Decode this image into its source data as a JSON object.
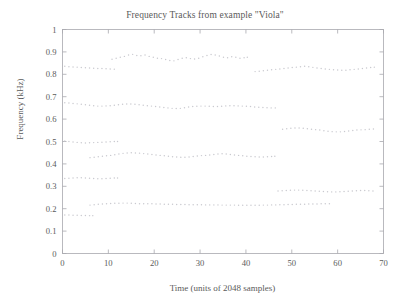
{
  "chart_data": {
    "type": "line",
    "title": "Frequency Tracks from example \"Viola\"",
    "xlabel": "Time (units of 2048 samples)",
    "ylabel": "Frequency (kHz)",
    "xlim": [
      0,
      70
    ],
    "ylim": [
      0,
      1
    ],
    "xticks": [
      0,
      10,
      20,
      30,
      40,
      50,
      60,
      70
    ],
    "yticks": [
      0,
      0.1,
      0.2,
      0.3,
      0.4,
      0.5,
      0.6,
      0.7,
      0.8,
      0.9,
      1
    ],
    "xtick_labels": [
      "0",
      "10",
      "20",
      "30",
      "40",
      "50",
      "60",
      "70"
    ],
    "ytick_labels": [
      "0",
      "0.1",
      "0.2",
      "0.3",
      "0.4",
      "0.5",
      "0.6",
      "0.7",
      "0.8",
      "0.9",
      "1"
    ],
    "grid": false,
    "legend": null,
    "marker": "dotted",
    "series_color": "#c9c9cf",
    "series": [
      {
        "name": "track-1-upper-left",
        "x": [
          0.5,
          1.4,
          2.3,
          3.2,
          4.1,
          5.0,
          5.9,
          6.8,
          7.7,
          8.6,
          9.5,
          10.4,
          11.3
        ],
        "values": [
          0.836,
          0.834,
          0.833,
          0.832,
          0.83,
          0.829,
          0.828,
          0.827,
          0.826,
          0.826,
          0.825,
          0.824,
          0.823
        ]
      },
      {
        "name": "track-2-upper-mid",
        "x": [
          10.8,
          11.7,
          12.6,
          13.5,
          14.4,
          15.3,
          16.2,
          17.1,
          18.0,
          18.9,
          19.8,
          20.7,
          21.6,
          22.5,
          23.4,
          24.3,
          25.2,
          26.1,
          27.0,
          27.9,
          28.8,
          29.7,
          30.6,
          31.5,
          32.4,
          33.3,
          34.2,
          35.1,
          36.0,
          36.9,
          37.8,
          38.7,
          39.6,
          40.3
        ],
        "values": [
          0.867,
          0.872,
          0.876,
          0.88,
          0.886,
          0.889,
          0.884,
          0.883,
          0.886,
          0.88,
          0.876,
          0.872,
          0.87,
          0.866,
          0.862,
          0.86,
          0.866,
          0.872,
          0.874,
          0.87,
          0.868,
          0.872,
          0.878,
          0.884,
          0.888,
          0.886,
          0.882,
          0.876,
          0.874,
          0.878,
          0.876,
          0.872,
          0.874,
          0.876
        ]
      },
      {
        "name": "track-3-upper-right",
        "x": [
          42.0,
          42.9,
          43.8,
          44.7,
          45.6,
          46.5,
          47.4,
          48.3,
          49.2,
          50.1,
          51.0,
          51.9,
          52.8,
          53.7,
          54.6,
          55.5,
          56.4,
          57.3,
          58.2,
          59.1,
          60.0,
          60.9,
          61.8,
          62.7,
          63.6,
          64.5,
          65.4,
          66.3,
          67.2,
          68.0
        ],
        "values": [
          0.812,
          0.814,
          0.816,
          0.818,
          0.82,
          0.822,
          0.824,
          0.826,
          0.828,
          0.83,
          0.832,
          0.834,
          0.836,
          0.834,
          0.831,
          0.828,
          0.826,
          0.824,
          0.822,
          0.82,
          0.819,
          0.818,
          0.818,
          0.82,
          0.822,
          0.824,
          0.826,
          0.828,
          0.83,
          0.832
        ]
      },
      {
        "name": "track-4-mid-left",
        "x": [
          0.5,
          1.4,
          2.3,
          3.2,
          4.1,
          5.0,
          5.9,
          6.8,
          7.7,
          8.6,
          9.5,
          10.4,
          11.3,
          12.2,
          13.1,
          14.0,
          14.9,
          15.8,
          16.7,
          17.6,
          18.5,
          19.4,
          20.3,
          21.2,
          22.1,
          23.0,
          23.9,
          24.8,
          25.7,
          26.6,
          27.5,
          28.4,
          29.3,
          30.2,
          31.1,
          32.0,
          32.9,
          33.8,
          34.7,
          35.6,
          36.5,
          37.4,
          38.3,
          39.2,
          40.1,
          41.0,
          41.9,
          42.8,
          43.7,
          44.6,
          45.5,
          46.4
        ],
        "values": [
          0.673,
          0.672,
          0.67,
          0.668,
          0.666,
          0.664,
          0.662,
          0.66,
          0.658,
          0.658,
          0.659,
          0.66,
          0.662,
          0.664,
          0.666,
          0.667,
          0.667,
          0.666,
          0.664,
          0.662,
          0.66,
          0.658,
          0.656,
          0.654,
          0.652,
          0.65,
          0.648,
          0.647,
          0.648,
          0.651,
          0.654,
          0.656,
          0.657,
          0.658,
          0.658,
          0.657,
          0.656,
          0.656,
          0.657,
          0.659,
          0.66,
          0.66,
          0.659,
          0.658,
          0.657,
          0.656,
          0.654,
          0.653,
          0.652,
          0.651,
          0.65,
          0.65
        ]
      },
      {
        "name": "track-5-mid-right",
        "x": [
          48.0,
          48.9,
          49.8,
          50.7,
          51.6,
          52.5,
          53.4,
          54.3,
          55.2,
          56.1,
          57.0,
          57.9,
          58.8,
          59.7,
          60.6,
          61.5,
          62.4,
          63.3,
          64.2,
          65.1,
          66.0,
          66.9,
          67.8
        ],
        "values": [
          0.555,
          0.557,
          0.559,
          0.56,
          0.56,
          0.559,
          0.557,
          0.555,
          0.553,
          0.551,
          0.548,
          0.546,
          0.544,
          0.543,
          0.543,
          0.545,
          0.547,
          0.549,
          0.551,
          0.552,
          0.553,
          0.555,
          0.556
        ]
      },
      {
        "name": "track-6-left-0p50",
        "x": [
          0.5,
          1.4,
          2.3,
          3.2,
          4.1,
          5.0,
          5.9,
          6.8,
          7.7,
          8.6,
          9.5,
          10.4,
          11.3,
          12.0
        ],
        "values": [
          0.502,
          0.5,
          0.498,
          0.496,
          0.494,
          0.493,
          0.494,
          0.495,
          0.496,
          0.497,
          0.498,
          0.499,
          0.5,
          0.5
        ]
      },
      {
        "name": "track-7-0p43",
        "x": [
          6.0,
          6.9,
          7.8,
          8.7,
          9.6,
          10.5,
          11.4,
          12.3,
          13.2,
          14.1,
          15.0,
          15.9,
          16.8,
          17.7,
          18.6,
          19.5,
          20.4,
          21.3,
          22.2,
          23.1,
          24.0,
          24.9,
          25.8,
          26.7,
          27.6,
          28.5,
          29.4,
          30.3,
          31.2,
          32.1,
          33.0,
          33.9,
          34.8,
          35.7,
          36.6,
          37.5,
          38.4,
          39.3,
          40.2,
          41.1,
          42.0,
          42.9,
          43.8,
          44.7,
          45.6,
          46.3
        ],
        "values": [
          0.428,
          0.43,
          0.432,
          0.434,
          0.436,
          0.438,
          0.441,
          0.444,
          0.447,
          0.449,
          0.45,
          0.449,
          0.448,
          0.446,
          0.444,
          0.442,
          0.44,
          0.438,
          0.436,
          0.434,
          0.432,
          0.431,
          0.43,
          0.43,
          0.431,
          0.433,
          0.435,
          0.437,
          0.438,
          0.44,
          0.442,
          0.444,
          0.445,
          0.444,
          0.442,
          0.44,
          0.438,
          0.436,
          0.434,
          0.433,
          0.432,
          0.431,
          0.431,
          0.432,
          0.433,
          0.434
        ]
      },
      {
        "name": "track-8-0p28-right",
        "x": [
          47.0,
          47.9,
          48.8,
          49.7,
          50.6,
          51.5,
          52.4,
          53.3,
          54.2,
          55.1,
          56.0,
          56.9,
          57.8,
          58.7,
          59.6,
          60.5,
          61.4,
          62.3,
          63.2,
          64.1,
          65.0,
          65.9,
          66.8,
          67.7
        ],
        "values": [
          0.279,
          0.28,
          0.281,
          0.282,
          0.283,
          0.283,
          0.282,
          0.281,
          0.28,
          0.279,
          0.278,
          0.277,
          0.276,
          0.275,
          0.275,
          0.276,
          0.277,
          0.278,
          0.279,
          0.28,
          0.281,
          0.281,
          0.28,
          0.279
        ]
      },
      {
        "name": "track-9-0p33-left",
        "x": [
          0.5,
          1.4,
          2.3,
          3.2,
          4.1,
          5.0,
          5.9,
          6.8,
          7.7,
          8.6,
          9.5,
          10.4,
          11.3,
          12.0
        ],
        "values": [
          0.335,
          0.336,
          0.337,
          0.338,
          0.338,
          0.337,
          0.336,
          0.335,
          0.334,
          0.334,
          0.335,
          0.336,
          0.337,
          0.337
        ]
      },
      {
        "name": "track-10-0p22-long",
        "x": [
          6.0,
          6.9,
          7.8,
          8.7,
          9.6,
          10.5,
          11.4,
          12.3,
          13.2,
          14.1,
          15.0,
          15.9,
          16.8,
          17.7,
          18.6,
          19.5,
          20.4,
          21.3,
          22.2,
          23.1,
          24.0,
          24.9,
          25.8,
          26.7,
          27.6,
          28.5,
          29.4,
          30.3,
          31.2,
          32.1,
          33.0,
          33.9,
          34.8,
          35.7,
          36.6,
          37.5,
          38.4,
          39.3,
          40.2,
          41.1,
          42.0,
          42.9,
          43.8,
          44.7,
          45.6,
          46.5,
          47.4,
          48.3,
          49.2,
          50.1,
          51.0,
          51.9,
          52.8,
          53.7,
          54.6,
          55.5,
          56.4,
          57.3,
          58.2
        ],
        "values": [
          0.216,
          0.218,
          0.22,
          0.221,
          0.222,
          0.223,
          0.224,
          0.224,
          0.225,
          0.225,
          0.224,
          0.223,
          0.222,
          0.222,
          0.222,
          0.222,
          0.221,
          0.221,
          0.22,
          0.22,
          0.22,
          0.219,
          0.219,
          0.219,
          0.218,
          0.218,
          0.218,
          0.218,
          0.217,
          0.217,
          0.217,
          0.217,
          0.216,
          0.216,
          0.216,
          0.216,
          0.215,
          0.215,
          0.215,
          0.215,
          0.215,
          0.215,
          0.216,
          0.216,
          0.217,
          0.217,
          0.218,
          0.218,
          0.219,
          0.219,
          0.22,
          0.22,
          0.22,
          0.221,
          0.221,
          0.221,
          0.222,
          0.222,
          0.222
        ]
      },
      {
        "name": "track-11-0p17-left",
        "x": [
          0.5,
          1.4,
          2.3,
          3.2,
          4.1,
          5.0,
          5.9,
          6.6
        ],
        "values": [
          0.172,
          0.172,
          0.171,
          0.171,
          0.17,
          0.17,
          0.169,
          0.169
        ]
      }
    ]
  },
  "axes": {
    "box_color": "#a8a8ae",
    "tick_color": "#a8a8ae"
  }
}
